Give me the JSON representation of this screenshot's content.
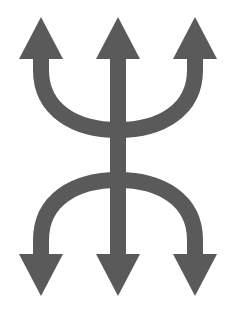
{
  "figure": {
    "colors": {
      "background": "#ffffff",
      "fill": "#5a5a5a"
    },
    "arrows": {
      "up": [
        "left",
        "center",
        "right"
      ],
      "down": [
        "left",
        "center",
        "right"
      ]
    }
  }
}
